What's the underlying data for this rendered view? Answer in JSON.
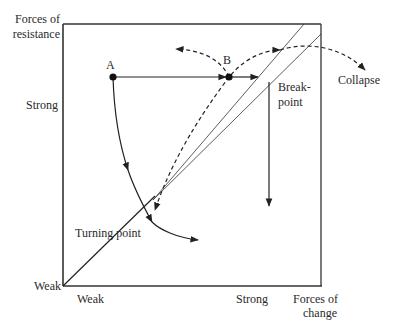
{
  "diagram": {
    "type": "force-field diagram",
    "y_axis": {
      "title": "Forces of resistance",
      "title_line1": "Forces of",
      "title_line2": "resistance",
      "high": "Strong",
      "low": "Weak"
    },
    "x_axis": {
      "title": "Forces of change",
      "title_line1": "Forces of",
      "title_line2": "change",
      "high": "Strong",
      "low": "Weak"
    },
    "points": [
      {
        "id": "A",
        "label": "A"
      },
      {
        "id": "B",
        "label": "B"
      }
    ],
    "annotations": {
      "breakpoint_line1": "Break-",
      "breakpoint_line2": "point",
      "collapse": "Collapse",
      "turning_point": "Turning point"
    },
    "colors": {
      "line": "#222222",
      "background": "#ffffff"
    }
  }
}
